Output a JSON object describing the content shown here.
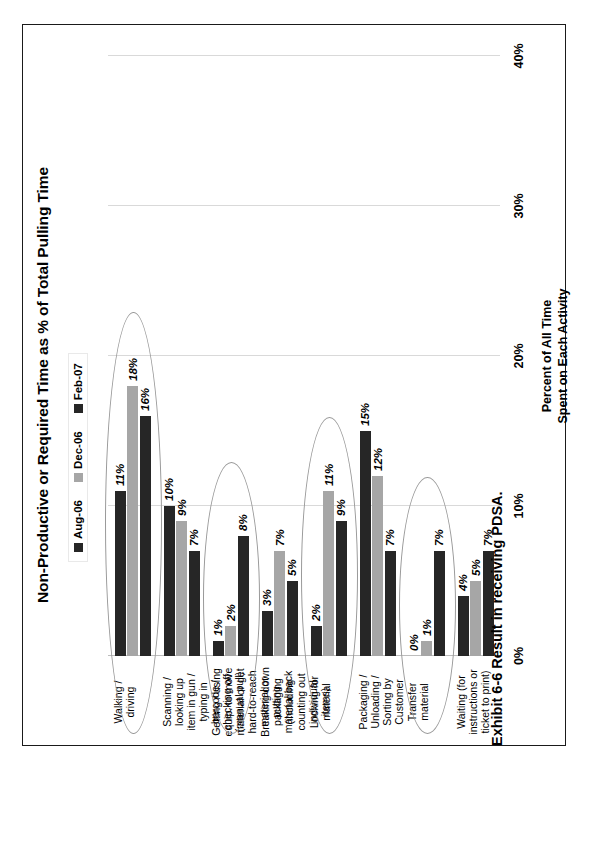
{
  "exhibit": {
    "caption": "Exhibit 6-6 Result in receiving PDSA."
  },
  "chart_data": {
    "type": "bar",
    "orientation": "horizontal-rotated",
    "title": "Non-Productive or Required Time as % of Total Pulling Time",
    "xlabel": "",
    "ylabel": "Percent of All Time Spent on Each Activity",
    "ylabel_line1": "Percent of All Time",
    "ylabel_line2": "Spent on Each Activity",
    "ylim": [
      0,
      40
    ],
    "tick_labels": [
      "0%",
      "10%",
      "20%",
      "30%",
      "40%"
    ],
    "tick_values": [
      0,
      10,
      20,
      30,
      40
    ],
    "grid": true,
    "legend_position": "top-left",
    "colors": {
      "aug06": "#262626",
      "dec06": "#a6a6a6",
      "feb07": "#262626",
      "gridline": "#d9d9d9",
      "ellipse": "#9a9a9a",
      "frame": "#1a1a1a"
    },
    "legend": [
      {
        "name": "Aug-06",
        "color": "#262626"
      },
      {
        "name": "Dec-06",
        "color": "#a6a6a6"
      },
      {
        "name": "Feb-07",
        "color": "#262626"
      }
    ],
    "categories": [
      "Walking / driving",
      "Scanning / looking up item in gun / typing in barcode / checking off (manual pull)",
      "Getting / using equip. to move material or get hard-to-reach material or putting material back",
      "Breaking down packaging (including counting out individual items)",
      "Looking for material",
      "Packaging / Unloading / Sorting by Customer",
      "Transfer material",
      "Waiting (for instructions or ticket to print)"
    ],
    "category_lines": [
      [
        "Walking /",
        "driving"
      ],
      [
        "Scanning /",
        "looking up",
        "item in gun /",
        "typing in",
        "barcode /",
        "checking off",
        "(manual pull)"
      ],
      [
        "Getting / using",
        "equip. to move",
        "material or get",
        "hard-to-reach",
        "material or",
        "putting",
        "material back"
      ],
      [
        "Breaking down",
        "packaging",
        "(including",
        "counting out",
        "individual",
        "items)"
      ],
      [
        "Looking for",
        "material"
      ],
      [
        "Packaging /",
        "Unloading /",
        "Sorting by",
        "Customer"
      ],
      [
        "Transfer",
        "material"
      ],
      [
        "Waiting (for",
        "instructions or",
        "ticket to print)"
      ]
    ],
    "series": [
      {
        "name": "Aug-06",
        "color": "#262626",
        "values": [
          16,
          7,
          8,
          5,
          9,
          7,
          7,
          7
        ],
        "labels": [
          "16%",
          "7%",
          "8%",
          "5%",
          "9%",
          "7%",
          "7%",
          "7%"
        ]
      },
      {
        "name": "Dec-06",
        "color": "#a6a6a6",
        "values": [
          18,
          9,
          2,
          7,
          11,
          12,
          1,
          5
        ],
        "labels": [
          "18%",
          "9%",
          "2%",
          "7%",
          "11%",
          "12%",
          "1%",
          "5%"
        ]
      },
      {
        "name": "Feb-07",
        "color": "#262626",
        "values": [
          11,
          10,
          1,
          3,
          2,
          15,
          0,
          4
        ],
        "labels": [
          "11%",
          "10%",
          "1%",
          "3%",
          "2%",
          "15%",
          "0%",
          "4%"
        ]
      }
    ],
    "highlighted_categories": [
      "Walking / driving",
      "Getting / using equip. to move material or get hard-to-reach material or putting material back",
      "Looking for material",
      "Transfer material"
    ]
  }
}
